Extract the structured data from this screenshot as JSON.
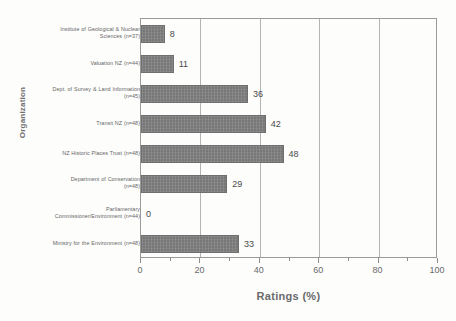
{
  "chart_data": {
    "type": "bar",
    "orientation": "horizontal",
    "title": "",
    "xlabel": "Ratings (%)",
    "ylabel": "Organization",
    "xlim": [
      0,
      100
    ],
    "xticks": [
      0,
      20,
      40,
      60,
      80,
      100
    ],
    "xtick_labels": [
      "0",
      "20",
      "40",
      "60",
      "80",
      "100"
    ],
    "minor_tick_interval": 10,
    "grid": "vertical-major",
    "legend": "none",
    "bar_color": "#787878",
    "categories": [
      "Institute of Geological & Nuclear Sciences (n=37)",
      "Valuation NZ (n=44)",
      "Dept. of Survey & Land Information (n=45)",
      "Transit NZ (n=48)",
      "NZ Historic Places Trust (n=48)",
      "Department of Conservation (n=48)",
      "Parliamentary Commissioner/Environment (n=44)",
      "Ministry for the Environment (n=48)"
    ],
    "values": [
      8,
      11,
      36,
      42,
      48,
      29,
      0,
      33
    ],
    "data_labels": [
      "8",
      "11",
      "36",
      "42",
      "48",
      "29",
      "0",
      "33"
    ],
    "category_lines": [
      [
        "Institute of Geological & Nuclear",
        "Sciences (n=37)"
      ],
      [
        "Valuation NZ (n=44)"
      ],
      [
        "Dept. of Survey & Land Information",
        "(n=45)"
      ],
      [
        "Transit NZ (n=48)"
      ],
      [
        "NZ Historic Places Trust (n=48)"
      ],
      [
        "Department of Conservation",
        "(n=48)"
      ],
      [
        "Parliamentary",
        "Commissioner/Environment (n=44)"
      ],
      [
        "Ministry for the Environment (n=48)"
      ]
    ]
  }
}
